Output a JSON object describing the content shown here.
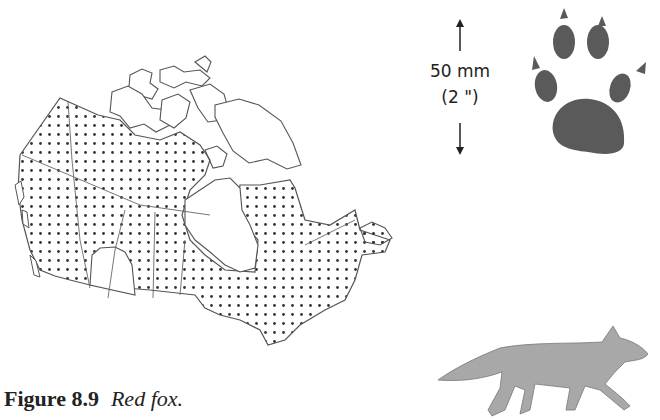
{
  "figure": {
    "number": "Figure 8.9",
    "title": "Red fox."
  },
  "scale": {
    "metric": "50 mm",
    "imperial": "(2 \")"
  },
  "map": {
    "region": "Canada",
    "legend": "dotted area = range",
    "fill_pattern": "dots",
    "colors": {
      "outline": "#555555",
      "dot": "#333333"
    }
  },
  "illustrations": {
    "track": "front paw print",
    "silhouette": "red fox walking",
    "colors": {
      "paw": "#5a5a5a",
      "fox": "#a8a8a8"
    }
  }
}
